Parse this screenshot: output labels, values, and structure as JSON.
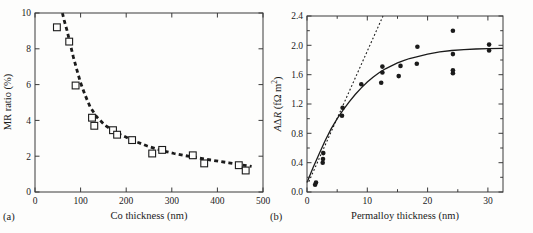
{
  "figure": {
    "background": "#fdfdfc",
    "ink_color": "#1b1b1b",
    "frame_color": "#3a3a3a",
    "panel_a_label": "(a)",
    "panel_b_label": "(b)"
  },
  "chart_data": [
    {
      "id": "panel-a",
      "type": "scatter",
      "title": "",
      "xlabel": "Co thickness (nm)",
      "ylabel": "MR ratio (%)",
      "xlim": [
        0,
        500
      ],
      "ylim": [
        0,
        10
      ],
      "grid": false,
      "legend": "none",
      "x_major_ticks": [
        0,
        100,
        200,
        300,
        400,
        500
      ],
      "x_tick_labels": [
        "0",
        "100",
        "200",
        "300",
        "400",
        "500"
      ],
      "x_minor_ticks": [],
      "y_major_ticks": [
        0,
        2,
        4,
        6,
        8,
        10
      ],
      "y_tick_labels": [
        "0",
        "2",
        "4",
        "6",
        "8",
        "10"
      ],
      "y_minor_ticks": [],
      "marker": "square-open",
      "series": [
        {
          "name": "MR ratio data",
          "points": [
            [
              48,
              9.2
            ],
            [
              75,
              8.4
            ],
            [
              89,
              5.95
            ],
            [
              125,
              4.15
            ],
            [
              130,
              3.7
            ],
            [
              171,
              3.45
            ],
            [
              180,
              3.2
            ],
            [
              213,
              2.9
            ],
            [
              257,
              2.15
            ],
            [
              279,
              2.35
            ],
            [
              346,
              2.05
            ],
            [
              371,
              1.6
            ],
            [
              447,
              1.5
            ],
            [
              462,
              1.2
            ]
          ]
        }
      ],
      "curves": [
        {
          "name": "fit (bold dashed)",
          "style": "bold-dashed",
          "points": [
            [
              60,
              10.0
            ],
            [
              65,
              9.5
            ],
            [
              70,
              9.05
            ],
            [
              77,
              8.3
            ],
            [
              84,
              7.55
            ],
            [
              92,
              6.8
            ],
            [
              100,
              6.1
            ],
            [
              110,
              5.4
            ],
            [
              121,
              4.75
            ],
            [
              135,
              4.2
            ],
            [
              153,
              3.74
            ],
            [
              170,
              3.45
            ],
            [
              188,
              3.2
            ],
            [
              205,
              3.0
            ],
            [
              225,
              2.78
            ],
            [
              245,
              2.58
            ],
            [
              265,
              2.42
            ],
            [
              285,
              2.27
            ],
            [
              305,
              2.15
            ],
            [
              325,
              2.05
            ],
            [
              345,
              1.96
            ],
            [
              365,
              1.87
            ],
            [
              385,
              1.79
            ],
            [
              405,
              1.71
            ],
            [
              425,
              1.63
            ],
            [
              445,
              1.55
            ],
            [
              465,
              1.47
            ],
            [
              475,
              1.43
            ]
          ]
        }
      ]
    },
    {
      "id": "panel-b",
      "type": "scatter",
      "title": "",
      "xlabel": "Permalloy thickness (nm)",
      "ylabel": "AΔR (fΩ m²)",
      "ylabel_segments": [
        {
          "text": "A",
          "italic": true
        },
        {
          "text": "Δ",
          "italic": false
        },
        {
          "text": "R",
          "italic": true
        },
        {
          "text": " (fΩ m",
          "italic": false
        },
        {
          "text": "2",
          "italic": false,
          "sup": true
        },
        {
          "text": ")",
          "italic": false
        }
      ],
      "xlim": [
        0,
        32.5
      ],
      "ylim": [
        0,
        2.4
      ],
      "grid": false,
      "legend": "none",
      "x_major_ticks": [
        0,
        10,
        20,
        30
      ],
      "x_tick_labels": [
        "0",
        "10",
        "20",
        "30"
      ],
      "x_minor_ticks": [
        5,
        15,
        25
      ],
      "y_major_ticks": [
        0,
        0.4,
        0.8,
        1.2,
        1.6,
        2.0,
        2.4
      ],
      "y_tick_labels": [
        "0.0",
        "0.4",
        "0.8",
        "1.2",
        "1.6",
        "2.0",
        "2.4"
      ],
      "y_minor_ticks": [
        0.2,
        0.6,
        1.0,
        1.4,
        1.8,
        2.2
      ],
      "marker": "circle-filled",
      "series": [
        {
          "name": "AΔR data",
          "points": [
            [
              1.35,
              0.1
            ],
            [
              1.5,
              0.13
            ],
            [
              2.6,
              0.4
            ],
            [
              2.65,
              0.45
            ],
            [
              2.7,
              0.53
            ],
            [
              5.8,
              1.04
            ],
            [
              5.9,
              1.15
            ],
            [
              9.0,
              1.47
            ],
            [
              12.3,
              1.49
            ],
            [
              12.5,
              1.63
            ],
            [
              12.5,
              1.71
            ],
            [
              15.2,
              1.58
            ],
            [
              15.5,
              1.72
            ],
            [
              18.2,
              1.75
            ],
            [
              18.3,
              1.98
            ],
            [
              24.2,
              1.62
            ],
            [
              24.2,
              1.66
            ],
            [
              24.2,
              1.88
            ],
            [
              24.2,
              2.2
            ],
            [
              30.2,
              1.93
            ],
            [
              30.2,
              2.01
            ]
          ]
        }
      ],
      "curves": [
        {
          "name": "saturating fit (solid)",
          "style": "solid",
          "points": [
            [
              0,
              0.13
            ],
            [
              1,
              0.33
            ],
            [
              2,
              0.52
            ],
            [
              3,
              0.7
            ],
            [
              4,
              0.86
            ],
            [
              5,
              1.0
            ],
            [
              6,
              1.12
            ],
            [
              7,
              1.23
            ],
            [
              8,
              1.33
            ],
            [
              9,
              1.42
            ],
            [
              10,
              1.5
            ],
            [
              11,
              1.57
            ],
            [
              12,
              1.63
            ],
            [
              13,
              1.68
            ],
            [
              14,
              1.72
            ],
            [
              15,
              1.76
            ],
            [
              16,
              1.79
            ],
            [
              17,
              1.82
            ],
            [
              18,
              1.84
            ],
            [
              19,
              1.86
            ],
            [
              20,
              1.88
            ],
            [
              22,
              1.91
            ],
            [
              24,
              1.93
            ],
            [
              26,
              1.94
            ],
            [
              28,
              1.95
            ],
            [
              30,
              1.955
            ],
            [
              32.5,
              1.96
            ]
          ]
        },
        {
          "name": "initial slope (dotted)",
          "style": "dotted",
          "points": [
            [
              0.3,
              0.14
            ],
            [
              12.6,
              2.4
            ]
          ]
        }
      ]
    }
  ]
}
